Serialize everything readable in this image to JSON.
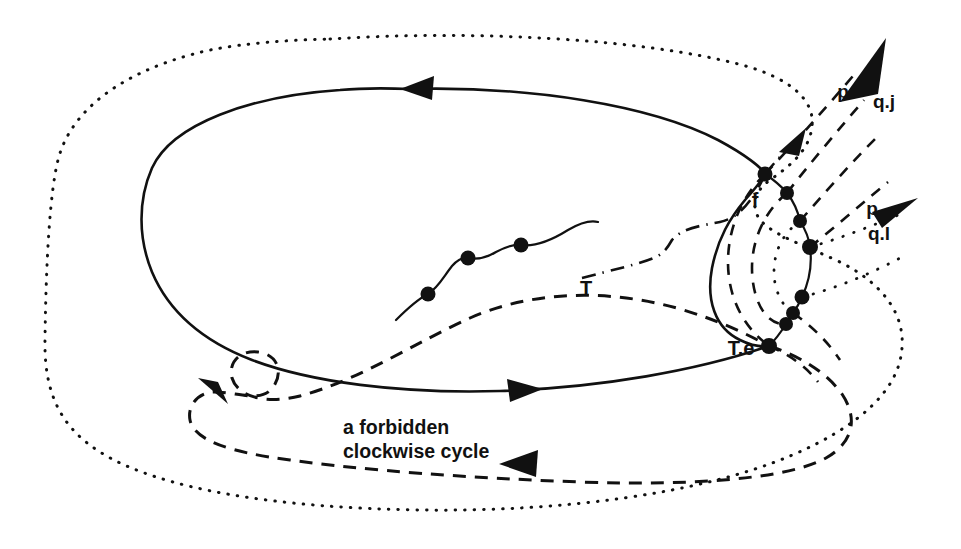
{
  "figure": {
    "title": "a forbidden clockwise cycle",
    "background_color": "#ffffff",
    "ink_color": "#111111",
    "width": 961,
    "height": 549
  },
  "labels": {
    "f": "f",
    "T": "T",
    "T_e": "T.e",
    "p_upper": "p",
    "q_j": "q.j",
    "p_lower": "p",
    "q_l": "q.l",
    "caption_line1": "a forbidden",
    "caption_line2": "clockwise cycle"
  },
  "curves": [
    {
      "name": "outer-dotted-boundary",
      "style": "dotted",
      "closed": true,
      "description": "outermost dotted closed contour enclosing whole figure"
    },
    {
      "name": "solid-cycle",
      "style": "solid",
      "closed": true,
      "direction": "counterclockwise",
      "description": "solid closed loop with two triangular direction arrows"
    },
    {
      "name": "forbidden-clockwise-cycle",
      "style": "dashed",
      "closed": true,
      "direction": "clockwise",
      "description": "dashed closed cycle with a small loop at lower left and a leftward arrow at the bottom"
    },
    {
      "name": "dash-dot-branch",
      "style": "dash-dot",
      "closed": false,
      "description": "dash-dot curve from the left, rising to the f node with an arrowhead"
    },
    {
      "name": "squiggle-chain",
      "style": "solid",
      "closed": false,
      "description": "wavy solid segment carrying three node dots"
    },
    {
      "name": "vertical-node-arc",
      "style": "solid",
      "closed": false,
      "description": "right-hand vertical arc threaded through eight node dots from f down to T.e"
    },
    {
      "name": "p-q-j-ray",
      "style": "dashed",
      "direction": "up-right",
      "description": "dashed ray leaving the node arc toward the p / q.j arrowhead"
    },
    {
      "name": "p-q-l-ray",
      "style": "dotted",
      "direction": "right",
      "description": "dotted ray leaving the node arc toward the p / q.l arrowhead"
    }
  ],
  "nodes": [
    {
      "name": "squiggle-node-1",
      "x": 428,
      "y": 294
    },
    {
      "name": "squiggle-node-2",
      "x": 468,
      "y": 258
    },
    {
      "name": "squiggle-node-3",
      "x": 521,
      "y": 245
    },
    {
      "name": "arc-node-f",
      "x": 765,
      "y": 174
    },
    {
      "name": "arc-node-2",
      "x": 787,
      "y": 193
    },
    {
      "name": "arc-node-3",
      "x": 800,
      "y": 221
    },
    {
      "name": "arc-node-4",
      "x": 810,
      "y": 247
    },
    {
      "name": "arc-node-5",
      "x": 802,
      "y": 297
    },
    {
      "name": "arc-node-6",
      "x": 793,
      "y": 313
    },
    {
      "name": "arc-node-7",
      "x": 786,
      "y": 324
    },
    {
      "name": "arc-node-te",
      "x": 769,
      "y": 346
    }
  ],
  "arrows": [
    {
      "name": "solid-cycle-top-arrow",
      "x": 416,
      "y": 89,
      "points": "left"
    },
    {
      "name": "solid-cycle-bottom-arrow",
      "x": 523,
      "y": 390,
      "points": "right"
    },
    {
      "name": "dashed-cycle-bottom-arrow",
      "x": 519,
      "y": 463,
      "points": "left"
    },
    {
      "name": "dashed-cycle-loop-arrow",
      "x": 214,
      "y": 392,
      "points": "up-left"
    },
    {
      "name": "dash-dot-arrow",
      "x": 797,
      "y": 139,
      "points": "up-right"
    },
    {
      "name": "q-j-arrow",
      "x": 869,
      "y": 58,
      "points": "up-right"
    },
    {
      "name": "q-l-arrow",
      "x": 901,
      "y": 206,
      "points": "right"
    }
  ]
}
